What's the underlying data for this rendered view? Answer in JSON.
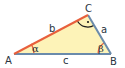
{
  "diagram": {
    "vertices": {
      "A": {
        "label": "A",
        "x": 14,
        "y": 54
      },
      "B": {
        "label": "B",
        "x": 111,
        "y": 54
      },
      "C": {
        "label": "C",
        "x": 88,
        "y": 15
      }
    },
    "sides": {
      "a": {
        "label": "a",
        "from": "B",
        "to": "C",
        "color": "#6a8bab"
      },
      "b": {
        "label": "b",
        "from": "A",
        "to": "C",
        "color": "#e8603c"
      },
      "c": {
        "label": "c",
        "from": "A",
        "to": "B",
        "color": "#6a8bab"
      }
    },
    "angles": {
      "alpha": {
        "label": "α",
        "vertex": "A",
        "color": "#e8603c"
      },
      "beta": {
        "label": "β",
        "vertex": "B",
        "color": "#e8603c"
      },
      "gamma": {
        "label": "·",
        "vertex": "C",
        "type": "right-angle",
        "color": "#1a1a1a"
      }
    },
    "fill_color": "#fdf3b8"
  }
}
